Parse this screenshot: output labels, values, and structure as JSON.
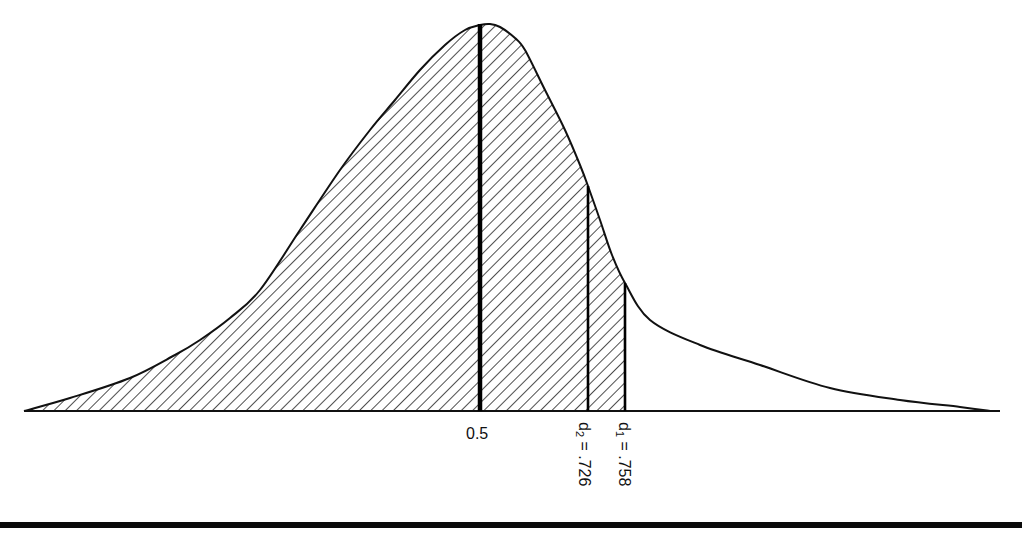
{
  "chart_data": {
    "type": "area",
    "title": "",
    "xlabel": "",
    "ylabel": "",
    "markers": [
      {
        "name": "median",
        "label": "0.5",
        "value": 0.5,
        "x_px": 480,
        "thick": true
      },
      {
        "name": "d2",
        "label_main": "d",
        "label_sub": "2",
        "label_rest": " = .726",
        "value": 0.726,
        "x_px": 588
      },
      {
        "name": "d1",
        "label_main": "d",
        "label_sub": "1",
        "label_rest": " = .758",
        "value": 0.758,
        "x_px": 625
      }
    ],
    "shaded_region": {
      "from": "left tail",
      "to": "d1",
      "pattern": "diagonal hatch"
    },
    "curve_points_px": [
      [
        24,
        411
      ],
      [
        70,
        398
      ],
      [
        130,
        378
      ],
      [
        175,
        355
      ],
      [
        200,
        340
      ],
      [
        230,
        318
      ],
      [
        260,
        290
      ],
      [
        300,
        230
      ],
      [
        340,
        170
      ],
      [
        370,
        130
      ],
      [
        395,
        100
      ],
      [
        420,
        70
      ],
      [
        445,
        45
      ],
      [
        465,
        30
      ],
      [
        480,
        25
      ],
      [
        490,
        24
      ],
      [
        500,
        27
      ],
      [
        515,
        38
      ],
      [
        525,
        50
      ],
      [
        545,
        90
      ],
      [
        565,
        130
      ],
      [
        580,
        165
      ],
      [
        588,
        186
      ],
      [
        600,
        220
      ],
      [
        612,
        255
      ],
      [
        625,
        283
      ],
      [
        650,
        320
      ],
      [
        700,
        345
      ],
      [
        760,
        365
      ],
      [
        830,
        388
      ],
      [
        900,
        400
      ],
      [
        960,
        407
      ],
      [
        990,
        411
      ]
    ],
    "baseline_px": {
      "x0": 24,
      "x1": 1000,
      "y": 411
    },
    "grid": false,
    "legend": null
  },
  "labels": {
    "median": "0.5",
    "d2_main": "d",
    "d2_sub": "2",
    "d2_rest": " = .726",
    "d1_main": "d",
    "d1_sub": "1",
    "d1_rest": " = .758"
  },
  "colors": {
    "ink": "#111111",
    "background": "#ffffff"
  }
}
